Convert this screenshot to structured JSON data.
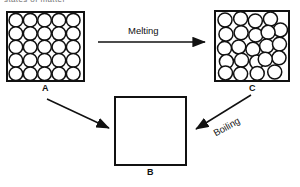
{
  "figure": {
    "caption_fragment": "states of matter",
    "boxes": [
      {
        "id": "A",
        "label": "A",
        "state": "solid",
        "arrangement": "ordered close-packed lattice",
        "particle_count": 25,
        "rows": 5,
        "columns": 5
      },
      {
        "id": "B",
        "label": "B",
        "state": "gas",
        "arrangement": "empty",
        "particle_count": 0,
        "rows": 0,
        "columns": 0
      },
      {
        "id": "C",
        "label": "C",
        "state": "liquid",
        "arrangement": "randomly packed",
        "particle_count": 23,
        "rows": 0,
        "columns": 0
      }
    ],
    "arrows": [
      {
        "id": "melting",
        "label": "Melting",
        "from": "A",
        "to": "C",
        "direction": "right"
      },
      {
        "id": "boiling",
        "label": "Boiling",
        "from": "C",
        "to": "B",
        "direction": "down-left"
      },
      {
        "id": "sublimation",
        "label": "",
        "from": "A",
        "to": "B",
        "direction": "down-right"
      }
    ],
    "colors": {
      "ink": "#111111",
      "background": "#ffffff",
      "circle_fill": "#ffffff"
    }
  }
}
